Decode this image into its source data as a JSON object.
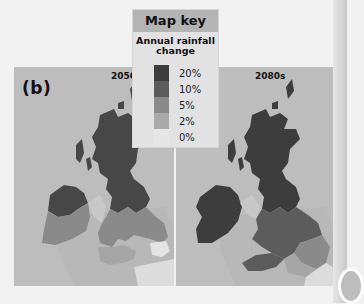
{
  "figure": {
    "panel_letter": "(b)",
    "colors": {
      "page_background": "#f2f2f2",
      "sea": "#bdbdbd",
      "key_header": "#b4b4b4",
      "key_background": "#e2e2e2"
    }
  },
  "map_key": {
    "title": "Map key",
    "subtitle": "Annual rainfall change",
    "items": [
      {
        "label": "20%",
        "color": "#3d3d3d"
      },
      {
        "label": "10%",
        "color": "#5c5c5c"
      },
      {
        "label": "5%",
        "color": "#8a8a8a"
      },
      {
        "label": "2%",
        "color": "#aaaaaa"
      },
      {
        "label": "0%",
        "color": "#e6e6e6"
      }
    ]
  },
  "maps": [
    {
      "period": "2050s",
      "regions": {
        "scotland": "20%",
        "northern_ireland": "20%",
        "northern_england": "20%",
        "ireland_north": "20%",
        "ireland_south": "5%",
        "wales": "5%",
        "midlands": "5%",
        "southern_england": "2%",
        "southeast_coast": "0%"
      }
    },
    {
      "period": "2080s",
      "regions": {
        "scotland": "20%",
        "northern_ireland": "20%",
        "northern_england": "20%",
        "ireland": "20%",
        "wales": "10%",
        "midlands": "10%",
        "east_anglia": "5%",
        "southern_england": "2%",
        "southeast_coast": "0%"
      }
    }
  ]
}
